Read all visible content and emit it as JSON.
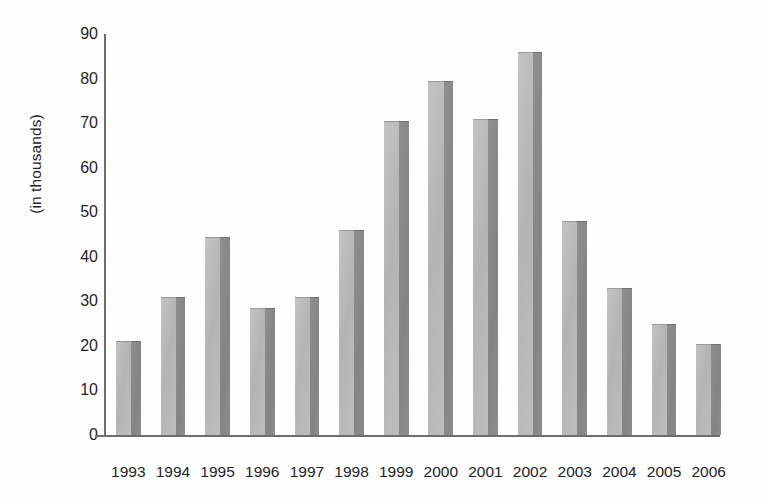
{
  "chart_data": {
    "type": "bar",
    "title": "",
    "subtitle": "",
    "xlabel": "",
    "ylabel": "(in thousands)",
    "categories": [
      "1993",
      "1994",
      "1995",
      "1996",
      "1997",
      "1998",
      "1999",
      "2000",
      "2001",
      "2002",
      "2003",
      "2004",
      "2005",
      "2006"
    ],
    "values": [
      21,
      31,
      44.5,
      28.5,
      31,
      46,
      70.5,
      79.5,
      71,
      86,
      48,
      33,
      25,
      20.5
    ],
    "series": [
      {
        "name": "",
        "values": [
          21,
          31,
          44.5,
          28.5,
          31,
          46,
          70.5,
          79.5,
          71,
          86,
          48,
          33,
          25,
          20.5
        ]
      }
    ],
    "ylim": [
      0,
      90
    ],
    "yticks": [
      0,
      10,
      20,
      30,
      40,
      50,
      60,
      70,
      80,
      90
    ],
    "ytick_labels": [
      "0",
      "10",
      "20",
      "30",
      "40",
      "50",
      "60",
      "70",
      "80",
      "90"
    ],
    "grid": false,
    "legend": "none",
    "legend_entries": [],
    "annotations": [],
    "colors": {
      "bar_face": "#b8b8b8",
      "bar_side": "#8a8a8a",
      "axis": "#6d6d6d",
      "text": "#1f1f1f",
      "background": "#ffffff"
    }
  }
}
